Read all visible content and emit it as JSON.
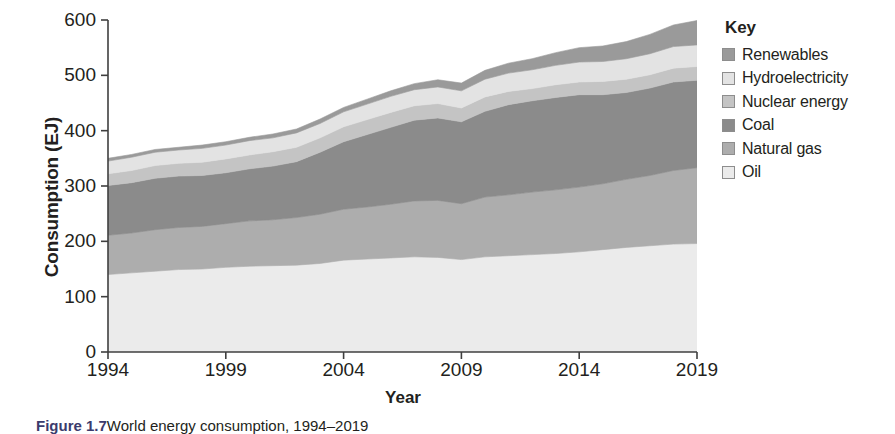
{
  "figure": {
    "x_axis_title": "Year",
    "y_axis_title": "Consumption (EJ)",
    "caption_label": "Figure 1.7",
    "caption_text": "World energy consumption, 1994–2019"
  },
  "legend": {
    "title": "Key",
    "items": [
      {
        "label": "Renewables",
        "color": "#9a9a9a"
      },
      {
        "label": "Hydroelectricity",
        "color": "#e3e3e3"
      },
      {
        "label": "Nuclear energy",
        "color": "#c4c4c4"
      },
      {
        "label": "Coal",
        "color": "#8b8b8b"
      },
      {
        "label": "Natural gas",
        "color": "#adadad"
      },
      {
        "label": "Oil",
        "color": "#ebebeb"
      }
    ]
  },
  "chart_data": {
    "type": "area",
    "stacked": true,
    "title": "",
    "xlabel": "Year",
    "ylabel": "Consumption (EJ)",
    "xlim": [
      1994,
      2019
    ],
    "ylim": [
      0,
      600
    ],
    "y_ticks": [
      0,
      100,
      200,
      300,
      400,
      500,
      600
    ],
    "x_ticks": [
      1994,
      1999,
      2004,
      2009,
      2014,
      2019
    ],
    "grid": false,
    "legend_position": "right",
    "x": [
      1994,
      1995,
      1996,
      1997,
      1998,
      1999,
      2000,
      2001,
      2002,
      2003,
      2004,
      2005,
      2006,
      2007,
      2008,
      2009,
      2010,
      2011,
      2012,
      2013,
      2014,
      2015,
      2016,
      2017,
      2018,
      2019
    ],
    "series": [
      {
        "name": "Oil",
        "color": "#ebebeb",
        "values": [
          140,
          143,
          146,
          149,
          150,
          153,
          155,
          156,
          157,
          160,
          166,
          168,
          170,
          172,
          171,
          167,
          172,
          174,
          176,
          178,
          181,
          185,
          189,
          192,
          195,
          196
        ]
      },
      {
        "name": "Natural gas",
        "color": "#adadad",
        "values": [
          71,
          72,
          75,
          76,
          77,
          79,
          82,
          83,
          86,
          89,
          92,
          94,
          97,
          101,
          103,
          101,
          108,
          110,
          113,
          115,
          117,
          119,
          123,
          127,
          133,
          137
        ]
      },
      {
        "name": "Coal",
        "color": "#8b8b8b",
        "values": [
          90,
          91,
          93,
          93,
          92,
          92,
          94,
          97,
          101,
          112,
          122,
          131,
          139,
          146,
          149,
          148,
          155,
          163,
          165,
          167,
          167,
          161,
          157,
          158,
          160,
          158
        ]
      },
      {
        "name": "Nuclear energy",
        "color": "#c4c4c4",
        "values": [
          21,
          22,
          23,
          23,
          24,
          25,
          25,
          26,
          26,
          26,
          27,
          27,
          27,
          26,
          26,
          25,
          26,
          24,
          22,
          23,
          23,
          24,
          24,
          24,
          25,
          25
        ]
      },
      {
        "name": "Hydroelectricity",
        "color": "#e3e3e3",
        "values": [
          23,
          24,
          24,
          24,
          25,
          25,
          26,
          25,
          26,
          26,
          27,
          28,
          29,
          29,
          30,
          31,
          32,
          33,
          34,
          35,
          36,
          36,
          37,
          38,
          39,
          39
        ]
      },
      {
        "name": "Renewables",
        "color": "#9a9a9a",
        "values": [
          5,
          5,
          5,
          5,
          6,
          6,
          6,
          7,
          7,
          8,
          8,
          9,
          10,
          11,
          13,
          14,
          16,
          18,
          20,
          23,
          26,
          28,
          31,
          35,
          39,
          44
        ]
      }
    ],
    "totals": [
      350,
      357,
      366,
      370,
      374,
      380,
      388,
      394,
      403,
      421,
      442,
      457,
      472,
      485,
      492,
      486,
      509,
      522,
      530,
      541,
      550,
      553,
      561,
      574,
      591,
      599
    ]
  }
}
